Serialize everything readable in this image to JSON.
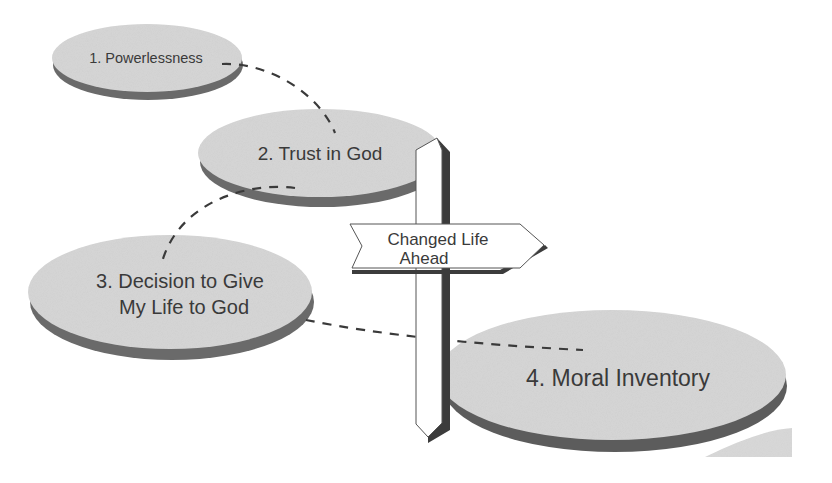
{
  "diagram": {
    "colors": {
      "disk_top": "#d6d6d6",
      "disk_edge": "#6a6a6a",
      "text": "#3a3a3a",
      "sign": "#ffffff",
      "sign_shadow": "#3c3c3c"
    },
    "steps": [
      {
        "id": 1,
        "label": "1. Powerlessness"
      },
      {
        "id": 2,
        "label": "2. Trust in God"
      },
      {
        "id": 3,
        "label_line1": "3. Decision to Give",
        "label_line2": "My Life to God"
      },
      {
        "id": 4,
        "label": "4. Moral Inventory"
      }
    ],
    "signpost": {
      "line1": "Changed Life",
      "line2": "Ahead"
    },
    "connectors": [
      {
        "from": 1,
        "to": 2,
        "style": "dashed"
      },
      {
        "from": 2,
        "to": 3,
        "style": "dashed"
      },
      {
        "from": 3,
        "to": 4,
        "style": "dashed"
      }
    ]
  }
}
